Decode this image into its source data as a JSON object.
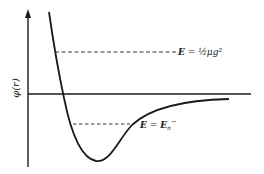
{
  "diagram": {
    "y_axis_label": "φ(r)",
    "levels": [
      {
        "name": "upper",
        "label_lhs": "E",
        "label_eq": " = ",
        "label_rhs": "½μg²"
      },
      {
        "name": "lower",
        "label_lhs": "E",
        "label_eq": " = ",
        "label_rhs_base": "E",
        "label_rhs_sub": "n",
        "label_rhs_sup": "−"
      }
    ],
    "colors": {
      "ink": "#1a1a1a",
      "background": "#ffffff"
    }
  }
}
